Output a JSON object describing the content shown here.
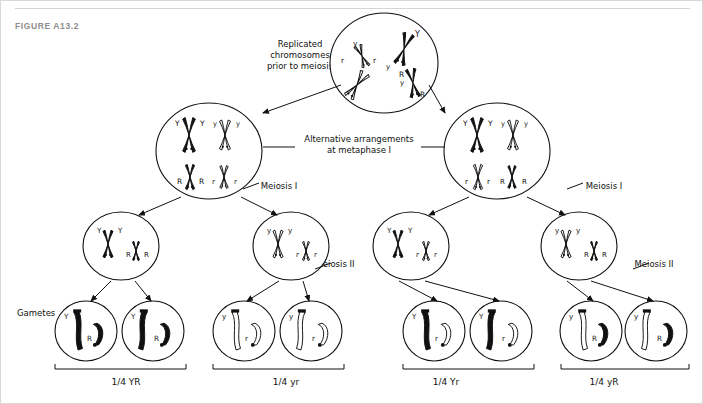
{
  "figure": {
    "label": "FIGURE A13.2",
    "title_color": "#8e8e8e"
  },
  "annotations": {
    "replicated": "Replicated\nchromosomes\nprior to meiosis",
    "alternative": "Alternative arrangements\nat metaphase I",
    "meiosis_1_left": "Meiosis I",
    "meiosis_1_right": "Meiosis I",
    "meiosis_2_left": "Meiosis II",
    "meiosis_2_right": "Meiosis II",
    "gametes": "Gametes"
  },
  "alleles": {
    "Y_dom": "Y",
    "y_rec": "y",
    "R_dom": "R",
    "r_rec": "r"
  },
  "parent_cell": {
    "name": "replicated-chromosomes-cell",
    "chromosomes": [
      {
        "allele": "Y",
        "shade": "black"
      },
      {
        "allele": "y",
        "shade": "white"
      },
      {
        "allele": "R",
        "shade": "black"
      },
      {
        "allele": "r",
        "shade": "white"
      }
    ]
  },
  "metaphase_cells": [
    {
      "name": "metaphase-cell-left",
      "arrangement": "Y-black | y-white  /  R-black | r-white",
      "top_pair": [
        {
          "allele": "Y",
          "shade": "black"
        },
        {
          "allele": "y",
          "shade": "white"
        }
      ],
      "bottom_pair": [
        {
          "allele": "R",
          "shade": "black"
        },
        {
          "allele": "r",
          "shade": "white"
        }
      ]
    },
    {
      "name": "metaphase-cell-right",
      "arrangement": "Y-black | y-white  /  r-white | R-black",
      "top_pair": [
        {
          "allele": "Y",
          "shade": "black"
        },
        {
          "allele": "y",
          "shade": "white"
        }
      ],
      "bottom_pair": [
        {
          "allele": "r",
          "shade": "white"
        },
        {
          "allele": "R",
          "shade": "black"
        }
      ]
    }
  ],
  "meiosis2_cells": [
    {
      "name": "meiosis2-cell-1",
      "left": {
        "allele": "Y",
        "shade": "black"
      },
      "right": {
        "allele": "R",
        "shade": "black"
      }
    },
    {
      "name": "meiosis2-cell-2",
      "left": {
        "allele": "y",
        "shade": "white"
      },
      "right": {
        "allele": "r",
        "shade": "white"
      }
    },
    {
      "name": "meiosis2-cell-3",
      "left": {
        "allele": "Y",
        "shade": "black"
      },
      "right": {
        "allele": "r",
        "shade": "white"
      }
    },
    {
      "name": "meiosis2-cell-4",
      "left": {
        "allele": "y",
        "shade": "white"
      },
      "right": {
        "allele": "R",
        "shade": "black"
      }
    }
  ],
  "gamete_groups": [
    {
      "name": "gamete-group-YR",
      "ratio": "1/4 YR",
      "left": {
        "allele": "Y",
        "shade": "black"
      },
      "right": {
        "allele": "R",
        "shade": "black"
      },
      "count": 2
    },
    {
      "name": "gamete-group-yr",
      "ratio": "1/4 yr",
      "left": {
        "allele": "y",
        "shade": "white"
      },
      "right": {
        "allele": "r",
        "shade": "white"
      },
      "count": 2
    },
    {
      "name": "gamete-group-Yr",
      "ratio": "1/4 Yr",
      "left": {
        "allele": "Y",
        "shade": "black"
      },
      "right": {
        "allele": "r",
        "shade": "white"
      },
      "count": 2
    },
    {
      "name": "gamete-group-yR",
      "ratio": "1/4 yR",
      "left": {
        "allele": "y",
        "shade": "white"
      },
      "right": {
        "allele": "R",
        "shade": "black"
      },
      "count": 2
    }
  ],
  "colors": {
    "ink": "#111111",
    "dominant_fill": "#111111",
    "recessive_fill": "#ffffff",
    "background": "#ffffff",
    "rule": "#d4d4d4"
  }
}
